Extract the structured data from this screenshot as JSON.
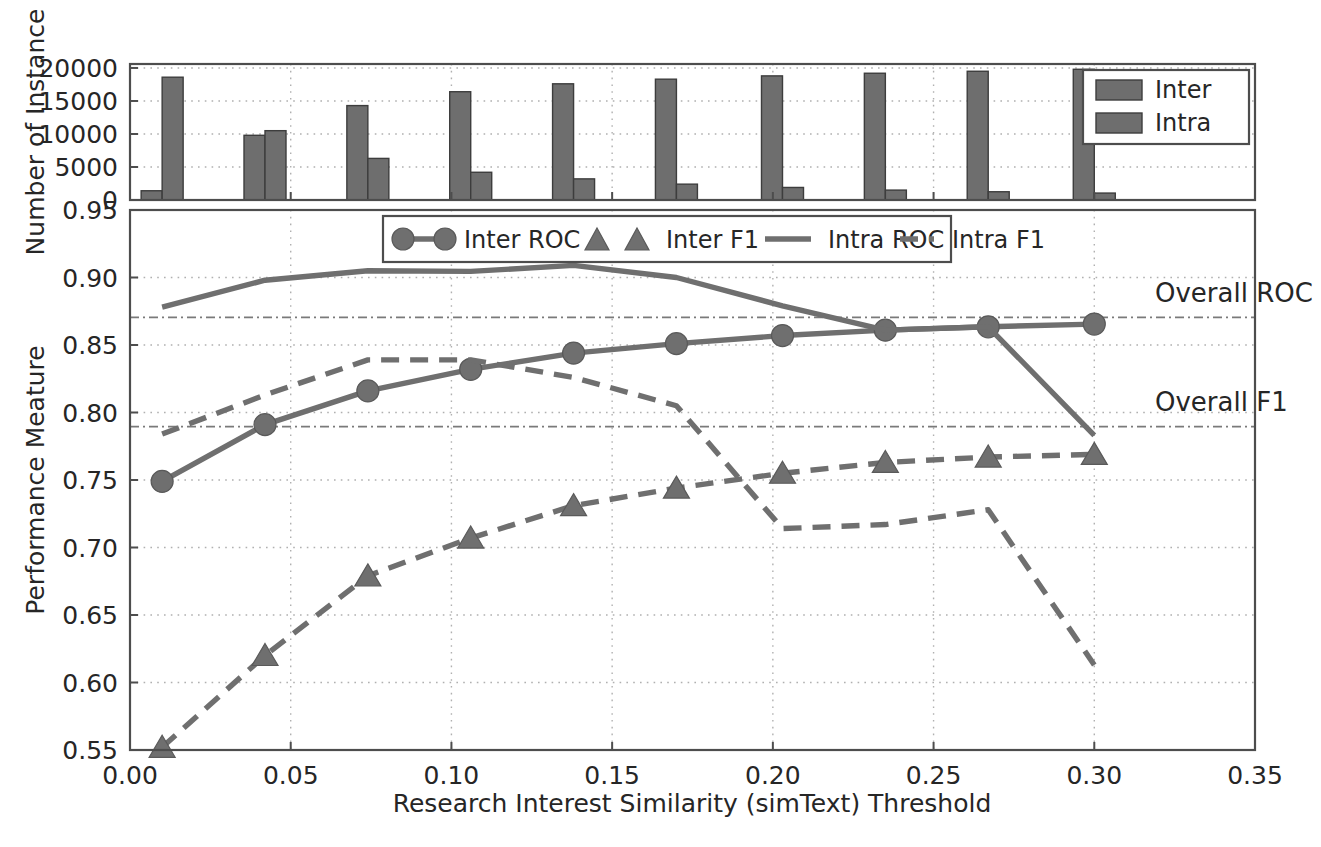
{
  "figure": {
    "background": "#ffffff",
    "series_color": "#6f6f6f",
    "bar_color": "#6e6e6e",
    "grid_color": "#b0b0b0",
    "axis_color": "#4d4d4d"
  },
  "top_panel": {
    "ylabel": "Number of Instance",
    "yticks": [
      "0",
      "5000",
      "10000",
      "15000",
      "20000"
    ],
    "legend": {
      "items": [
        {
          "label": "Inter",
          "swatch": "bar-swatch"
        },
        {
          "label": "Intra",
          "swatch": "bar-swatch"
        }
      ]
    }
  },
  "main_panel": {
    "ylabel": "Performance Meature",
    "xlabel": "Research Interest Similarity (simText) Threshold",
    "yticks": [
      "0.55",
      "0.60",
      "0.65",
      "0.70",
      "0.75",
      "0.80",
      "0.85",
      "0.90",
      "0.95"
    ],
    "xticks": [
      "0.00",
      "0.05",
      "0.10",
      "0.15",
      "0.20",
      "0.25",
      "0.30",
      "0.35"
    ],
    "legend": {
      "items": [
        {
          "label": "Inter ROC",
          "style": "solid-circle"
        },
        {
          "label": "Inter F1",
          "style": "dashed-triangle"
        },
        {
          "label": "Intra ROC",
          "style": "solid-line"
        },
        {
          "label": "Intra F1",
          "style": "dashed-line"
        }
      ]
    },
    "annotations": [
      {
        "label": "Overall ROC",
        "value": 0.8705
      },
      {
        "label": "Overall F1",
        "value": 0.7895
      }
    ]
  },
  "chart_data": [
    {
      "type": "bar",
      "title": "",
      "xlabel": "",
      "ylabel": "Number of Instance",
      "ylim": [
        0,
        20600
      ],
      "xlim": [
        0.0,
        0.35
      ],
      "grid": true,
      "legend_position": "upper-right",
      "categories": [
        0.01,
        0.042,
        0.074,
        0.106,
        0.138,
        0.17,
        0.203,
        0.235,
        0.267,
        0.3
      ],
      "series": [
        {
          "name": "Inter",
          "values": [
            1400,
            9800,
            14300,
            16400,
            17600,
            18300,
            18800,
            19200,
            19500,
            19800
          ]
        },
        {
          "name": "Intra",
          "values": [
            18600,
            10500,
            6300,
            4200,
            3200,
            2400,
            1900,
            1500,
            1250,
            1050
          ]
        }
      ]
    },
    {
      "type": "line",
      "title": "",
      "xlabel": "Research Interest Similarity (simText) Threshold",
      "ylabel": "Performance Meature",
      "xlim": [
        0.0,
        0.35
      ],
      "ylim": [
        0.55,
        0.95
      ],
      "grid": true,
      "legend_position": "upper-center",
      "x": [
        0.01,
        0.042,
        0.074,
        0.106,
        0.138,
        0.17,
        0.203,
        0.235,
        0.267,
        0.3
      ],
      "series": [
        {
          "name": "Inter ROC",
          "style": "solid",
          "marker": "circle",
          "values": [
            0.749,
            0.791,
            0.816,
            0.832,
            0.844,
            0.851,
            0.857,
            0.861,
            0.8635,
            0.8655
          ]
        },
        {
          "name": "Inter F1",
          "style": "dashed",
          "marker": "triangle",
          "values": [
            0.552,
            0.62,
            0.679,
            0.707,
            0.731,
            0.744,
            0.755,
            0.763,
            0.767,
            0.769
          ]
        },
        {
          "name": "Intra ROC",
          "style": "solid",
          "marker": "none",
          "values": [
            0.878,
            0.898,
            0.905,
            0.9045,
            0.909,
            0.9,
            0.879,
            0.861,
            0.8635,
            0.783
          ]
        },
        {
          "name": "Intra F1",
          "style": "dashed",
          "marker": "none",
          "values": [
            0.784,
            0.813,
            0.839,
            0.839,
            0.826,
            0.805,
            0.714,
            0.717,
            0.728,
            0.613
          ]
        }
      ],
      "reference_lines": [
        {
          "name": "Overall ROC",
          "value": 0.8705
        },
        {
          "name": "Overall F1",
          "value": 0.7895
        }
      ]
    }
  ]
}
